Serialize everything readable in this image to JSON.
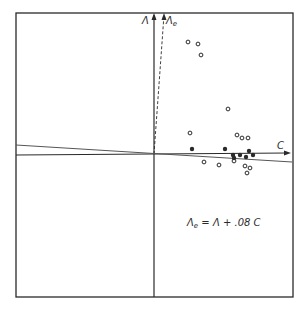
{
  "diagram": {
    "axes": {
      "vertical_label": "Λ",
      "rotated_label": "Λ",
      "rotated_label_sub": "e",
      "horizontal_label": "C"
    },
    "equation": {
      "lhs": "Λ",
      "lhs_sub": "e",
      "rhs": " = Λ + .08 C"
    },
    "colors": {
      "ink": "#2a2a2a",
      "background": "#ffffff"
    },
    "points_open": [
      [
        188,
        42
      ],
      [
        198,
        44
      ],
      [
        201,
        55
      ],
      [
        228,
        109
      ],
      [
        190,
        133
      ],
      [
        237,
        135
      ],
      [
        242,
        138
      ],
      [
        248,
        138
      ],
      [
        204,
        162
      ],
      [
        219,
        165
      ],
      [
        234,
        161
      ],
      [
        245,
        166
      ],
      [
        250,
        168
      ],
      [
        247,
        173
      ]
    ],
    "points_filled": [
      [
        192,
        149
      ],
      [
        225,
        149
      ],
      [
        249,
        151
      ],
      [
        233,
        155
      ],
      [
        240,
        155
      ],
      [
        246,
        157
      ],
      [
        253,
        155
      ],
      [
        234,
        158
      ]
    ]
  }
}
